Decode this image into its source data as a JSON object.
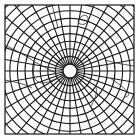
{
  "map": {
    "type": "polar azimuthal graticule",
    "frame": {
      "x": 5,
      "y": 5,
      "width": 129,
      "height": 129
    },
    "center": {
      "x": 70,
      "y": 71
    },
    "pole_circle_radius": 7,
    "parallels_count": 14,
    "parallel_spacing": 7,
    "meridians_count": 36,
    "meridian_step_deg": 10,
    "colors": {
      "background": "#ffffff",
      "grid": "#1a1a1a",
      "coast": "#2a2a2a"
    }
  }
}
